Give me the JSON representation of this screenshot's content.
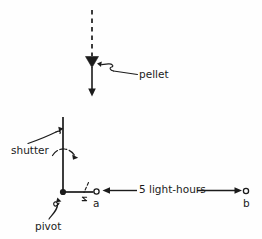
{
  "figure": {
    "background_color": "#fefefe",
    "ink_color": "#1b1b1b"
  },
  "labels": {
    "pellet": "pellet",
    "shutter": "shutter",
    "pivot": "pivot",
    "distance": "5 light-hours",
    "point_a": "a",
    "point_b": "b"
  },
  "geometry": {
    "pellet_path_x": 92,
    "pellet_dash_top_y": 10,
    "pellet_triangle_y": 62,
    "pellet_arrow_bottom_y": 96,
    "shutter_bar_x": 63,
    "shutter_bar_top_y": 117,
    "pivot_x": 63,
    "pivot_y": 192,
    "point_a_x": 96,
    "point_b_x": 246,
    "baseline_y": 192,
    "measure_arrow_left_x": 104,
    "measure_arrow_right_x": 240
  },
  "elements": {
    "pellet_trajectory": "dashed-vertical-line-with-downward-arrow",
    "pellet_marker": "filled-down-triangle",
    "shutter": "vertical-bar-rotating-about-pivot",
    "shutter_rotation": "curved-arrow-clockwise",
    "pivot": "filled-dot",
    "point_a_marker": "small-open-circle",
    "point_b_marker": "small-open-circle",
    "distance_measure": "double-headed-horizontal-arrow"
  }
}
